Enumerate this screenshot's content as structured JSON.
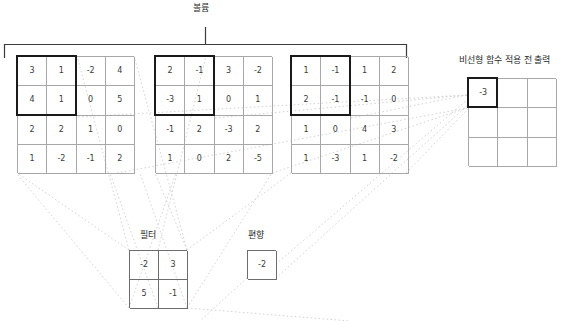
{
  "diagram": {
    "title_top": "볼륨",
    "output_label": "비선형 함수 적용 전 출력",
    "filter_label": "필터",
    "bias_label": "편향",
    "colors": {
      "grid_line": "#a8a8a8",
      "highlight_border": "#1a1a1a",
      "dotted_line": "#cfcfcf",
      "bracket": "#3b3b3b",
      "text": "#333333"
    },
    "volume": {
      "label": "볼륨",
      "depth": 3,
      "rows": 4,
      "cols": 4,
      "slices": [
        {
          "index": 0,
          "values": [
            [
              3,
              1,
              -2,
              4
            ],
            [
              4,
              1,
              0,
              5
            ],
            [
              2,
              2,
              1,
              0
            ],
            [
              1,
              -2,
              -1,
              2
            ]
          ],
          "highlight": {
            "row": 0,
            "col": 0,
            "rows": 2,
            "cols": 2
          }
        },
        {
          "index": 1,
          "values": [
            [
              2,
              -1,
              3,
              -2
            ],
            [
              -3,
              1,
              0,
              1
            ],
            [
              -1,
              2,
              -3,
              2
            ],
            [
              1,
              0,
              2,
              -5
            ]
          ],
          "highlight": {
            "row": 0,
            "col": 0,
            "rows": 2,
            "cols": 2
          }
        },
        {
          "index": 2,
          "values": [
            [
              1,
              -1,
              1,
              2
            ],
            [
              2,
              -1,
              -1,
              0
            ],
            [
              1,
              0,
              4,
              3
            ],
            [
              1,
              -3,
              1,
              -2
            ]
          ],
          "highlight": {
            "row": 0,
            "col": 0,
            "rows": 2,
            "cols": 2
          }
        }
      ]
    },
    "filter": {
      "label": "필터",
      "rows": 2,
      "cols": 2,
      "values": [
        [
          -2,
          3
        ],
        [
          5,
          -1
        ]
      ]
    },
    "bias": {
      "label": "편향",
      "rows": 1,
      "cols": 1,
      "values": [
        [
          -2
        ]
      ]
    },
    "output": {
      "label": "비선형 함수 적용 전 출력",
      "rows": 3,
      "cols": 3,
      "values": [
        [
          "-3",
          "",
          ""
        ],
        [
          "",
          "",
          ""
        ],
        [
          "",
          "",
          ""
        ]
      ],
      "highlight": {
        "row": 0,
        "col": 0,
        "rows": 1,
        "cols": 1
      }
    }
  }
}
